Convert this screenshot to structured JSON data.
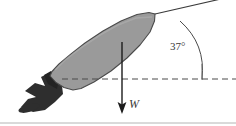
{
  "figure": {
    "canvas": {
      "width": 236,
      "height": 126,
      "background": "#ffffff"
    },
    "border": {
      "visible": true,
      "edge": "bottom",
      "color": "#b4b4b4"
    }
  },
  "labels": {
    "angle": "37°",
    "weight": "W"
  },
  "annotations": {
    "angle_value": 37,
    "angle_unit": "degrees",
    "weight_symbol": "W",
    "weight_direction": "down"
  },
  "colors": {
    "body_fill": "#9a9a9a",
    "body_stroke": "#4a4a4a",
    "exhaust_fill": "#2e2e2e",
    "line": "#3a3a3a",
    "dashed_line": "#4a4a4a",
    "text": "#3a3a3a",
    "border": "#b4b4b4"
  },
  "geometry": {
    "rocket": {
      "nose_tip": [
        155,
        14
      ],
      "tail_center": [
        63,
        79
      ],
      "inclination_deg": 37,
      "outline": "M155,14 L150,13 L138,15 L122,22 L104,32 L86,44 L72,55 L60,65 L53,72 L51,76 L56,82 L64,87 L72,90 L80,89 L93,83 L110,72 L126,59 L139,46 L149,33 L154,22 Z"
    },
    "exhaust": {
      "plume_main": "M57,80 L48,74 L40,78 L44,86 L36,84 L26,92 L36,98 L29,100 L22,108 L34,112 L46,110 L55,103 L62,95 L60,88 Z",
      "plume_inner": "M57,79 L50,73 L43,77 L47,85 L55,90 Z",
      "ember_ellipse": {
        "cx": 28,
        "cy": 108,
        "rx": 11,
        "ry": 4,
        "rotation": -16
      }
    },
    "weight_arrow": {
      "x": 122,
      "y_start": 42,
      "y_end": 113
    },
    "dashed_line": {
      "y": 79,
      "x_start": 62,
      "x_end": 236
    },
    "angle_line": {
      "x1": 155,
      "y1": 14,
      "x2": 232,
      "y2": -3
    },
    "angle_arc": {
      "start": [
        178,
        20
      ],
      "end": [
        202,
        79
      ],
      "radius": 66
    },
    "tick_mark": {
      "x": 202,
      "y_start": 66,
      "y_end": 80
    }
  }
}
